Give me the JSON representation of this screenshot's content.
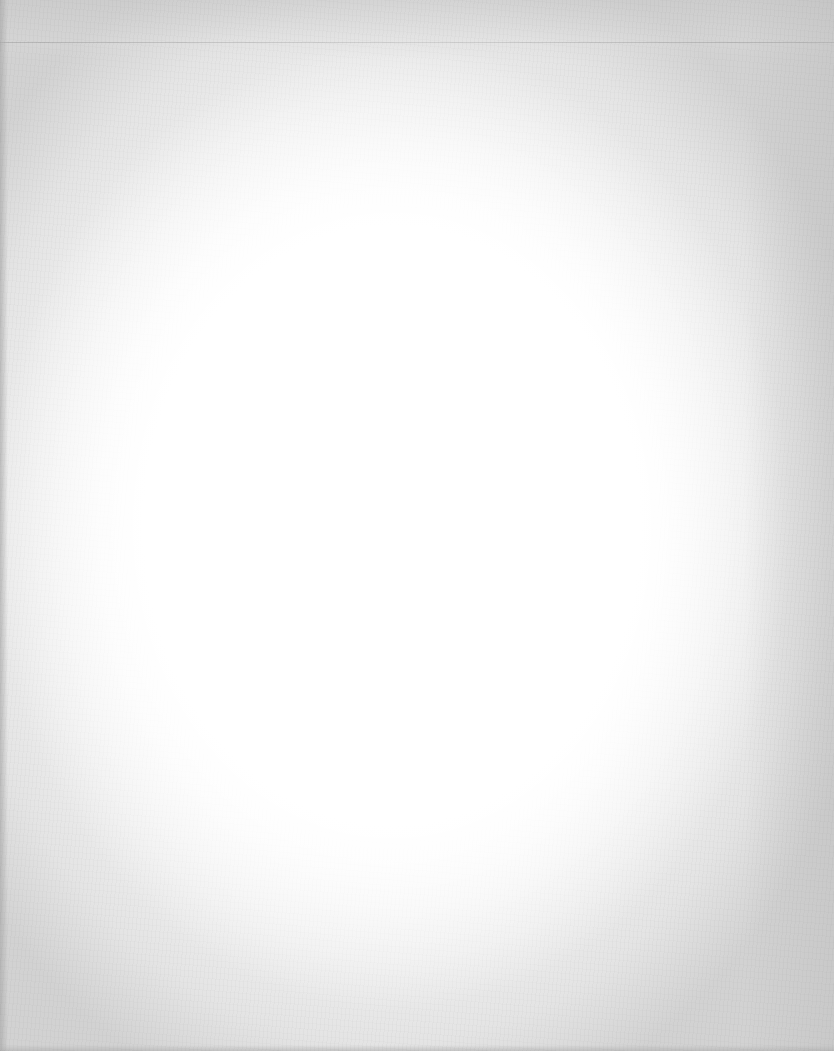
{
  "document": {
    "type": "scanned-page",
    "content": "",
    "paper_color": "#ffffff",
    "edge_shade_color": "#d2d2d2",
    "rule_color": "#aaaaaa"
  }
}
